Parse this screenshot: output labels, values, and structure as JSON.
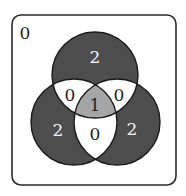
{
  "diagram": {
    "type": "venn",
    "sets": 3,
    "colors": {
      "background": "#ffffff",
      "frame_stroke": "#2a2a2a",
      "single_region": "#4d4d4d",
      "pairwise_region": "#ffffff",
      "triple_region": "#a6a6a6",
      "outline": "#1a1a1a",
      "light_text": "#f2f2f2",
      "dark_text": "#1e1e1e"
    },
    "regions": {
      "outside": "0",
      "top_only": "2",
      "left_only": "2",
      "right_only": "2",
      "top_left": "0",
      "top_right": "0",
      "left_right": "0",
      "all_three": "1"
    }
  }
}
